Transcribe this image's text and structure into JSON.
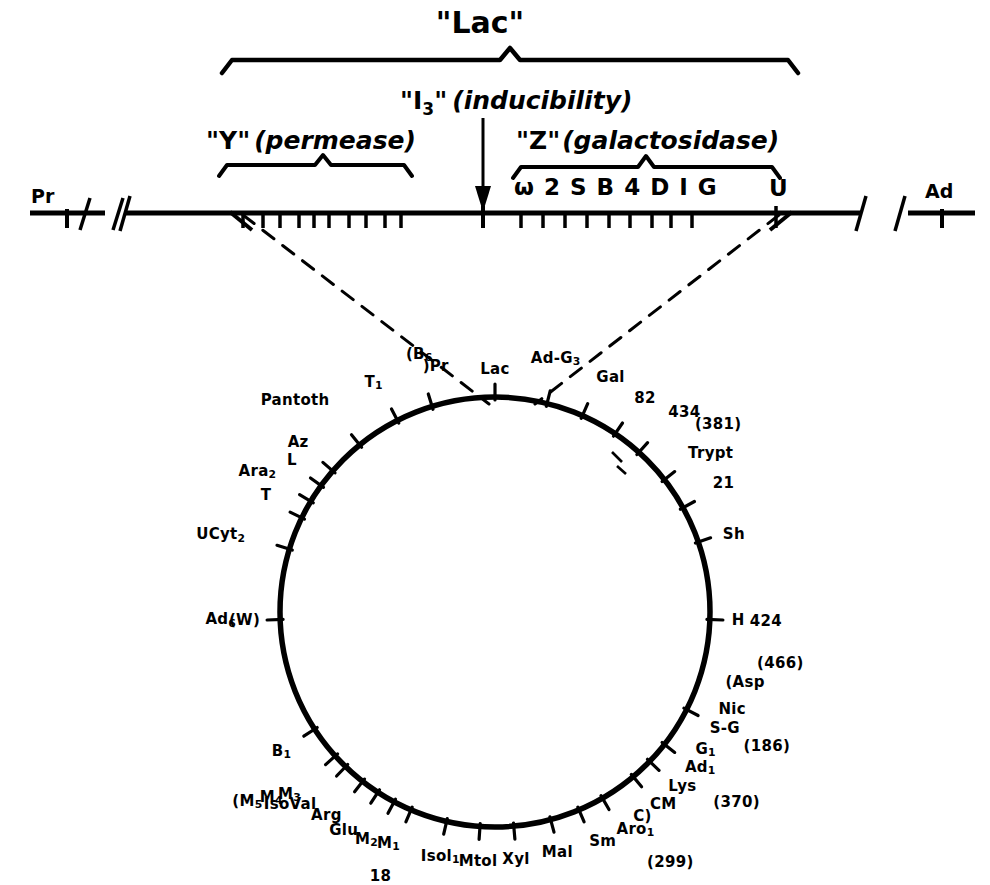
{
  "figure": {
    "type": "genetic-map",
    "title_top": "\"Lac\""
  },
  "linear_map": {
    "left_marker": "Pr",
    "right_marker": "Ad",
    "brackets": [
      {
        "id": "lac",
        "label": "\"Lac\"",
        "qualifier": ""
      },
      {
        "id": "y",
        "label": "\"Y\"",
        "qualifier": "(permease)"
      },
      {
        "id": "z",
        "label": "\"Z\"",
        "qualifier": "(galactosidase)"
      }
    ],
    "arrow_label_main": "\"I",
    "arrow_label_sub": "3",
    "arrow_label_close": "\"",
    "arrow_label_qualifier": "(inducibility)",
    "site_markers": [
      "ω",
      "2",
      "S",
      "B",
      "4",
      "D",
      "I",
      "G"
    ],
    "far_right_site": "U",
    "left_tick_count": 11,
    "right_tick_count": 10
  },
  "circular_map": {
    "center_label": "",
    "markers": [
      {
        "label": "Lac",
        "angle": 270,
        "r_label": 20,
        "tick": true,
        "side": "out"
      },
      {
        "label": "Ad-G",
        "sub": "3",
        "angle": 284,
        "r_label": 36,
        "tick": true,
        "side": "out"
      },
      {
        "label": "Gal",
        "angle": 294,
        "r_label": 34,
        "tick": true,
        "side": "out"
      },
      {
        "label": "82",
        "angle": 304,
        "r_label": 34,
        "tick": true,
        "side": "out"
      },
      {
        "label": "434",
        "angle": 312,
        "r_label": 44,
        "tick": true,
        "side": "out"
      },
      {
        "label": "(381)",
        "angle": 318,
        "r_label": 54,
        "tick": false,
        "side": "out"
      },
      {
        "label": "Trypt",
        "angle": 322,
        "r_label": 30,
        "tick": true,
        "side": "out"
      },
      {
        "label": "21",
        "angle": 331,
        "r_label": 34,
        "tick": true,
        "side": "out"
      },
      {
        "label": "Sh",
        "angle": 341,
        "r_label": 26,
        "tick": true,
        "side": "out"
      },
      {
        "label": "424",
        "angle": 2,
        "r_label": 40,
        "tick": true,
        "side": "out"
      },
      {
        "label": "H",
        "angle": 2,
        "r_label": 22,
        "tick": false,
        "side": "out"
      },
      {
        "label": "(466)",
        "angle": 11,
        "r_label": 52,
        "tick": false,
        "side": "out"
      },
      {
        "label": "(Asp",
        "angle": 17,
        "r_label": 26,
        "tick": false,
        "side": "out"
      },
      {
        "label": "Nic",
        "angle": 22,
        "r_label": 26,
        "tick": false,
        "side": "out"
      },
      {
        "label": "S-G",
        "angle": 27,
        "r_label": 26,
        "tick": true,
        "side": "out"
      },
      {
        "label": "(186)",
        "angle": 27,
        "r_label": 64,
        "tick": false,
        "side": "out"
      },
      {
        "label": "G",
        "sub": "1",
        "angle": 33,
        "r_label": 24,
        "tick": false,
        "side": "out"
      },
      {
        "label": "Ad",
        "sub": "1",
        "angle": 38,
        "r_label": 26,
        "tick": true,
        "side": "out"
      },
      {
        "label": "(370)",
        "angle": 40,
        "r_label": 70,
        "tick": false,
        "side": "out"
      },
      {
        "label": "Lys",
        "angle": 44,
        "r_label": 26,
        "tick": true,
        "side": "out"
      },
      {
        "label": "CM",
        "angle": 50,
        "r_label": 26,
        "tick": true,
        "side": "out"
      },
      {
        "label": "C)",
        "angle": 55,
        "r_label": 26,
        "tick": false,
        "side": "out"
      },
      {
        "label": "Aro",
        "sub": "1",
        "angle": 60,
        "r_label": 28,
        "tick": true,
        "side": "out"
      },
      {
        "label": "(299)",
        "angle": 58,
        "r_label": 72,
        "tick": false,
        "side": "out"
      },
      {
        "label": "Sm",
        "angle": 67,
        "r_label": 26,
        "tick": true,
        "side": "out"
      },
      {
        "label": "Mal",
        "angle": 75,
        "r_label": 26,
        "tick": true,
        "side": "out"
      },
      {
        "label": "Xyl",
        "angle": 85,
        "r_label": 26,
        "tick": true,
        "side": "out"
      },
      {
        "label": "Mtol",
        "angle": 94,
        "r_label": 28,
        "tick": true,
        "side": "out"
      },
      {
        "label": "Isol",
        "sub": "1",
        "angle": 103,
        "r_label": 28,
        "tick": true,
        "side": "out"
      },
      {
        "label": "M",
        "sub": "1",
        "angle": 113,
        "r_label": 28,
        "tick": true,
        "side": "out"
      },
      {
        "label": "M",
        "sub": "2",
        "angle": 118,
        "r_label": 34,
        "tick": true,
        "side": "out"
      },
      {
        "label": "18",
        "angle": 112,
        "r_label": 62,
        "tick": false,
        "side": "out"
      },
      {
        "label": "Glu",
        "angle": 123,
        "r_label": 36,
        "tick": true,
        "side": "out"
      },
      {
        "label": "Arg",
        "angle": 128,
        "r_label": 34,
        "tick": true,
        "side": "out"
      },
      {
        "label": "IsoVal",
        "angle": 134,
        "r_label": 42,
        "tick": true,
        "side": "out"
      },
      {
        "label": "(M",
        "sub": "5",
        "angle": 142,
        "r_label": 80,
        "tick": false,
        "side": "out"
      },
      {
        "label": "M",
        "sub": "4",
        "angle": 140,
        "r_label": 62,
        "tick": false,
        "side": "out"
      },
      {
        "label": "M",
        "sub": "3",
        "angle": 138,
        "r_label": 46,
        "tick": true,
        "side": "out"
      },
      {
        "label": "B",
        "sub": "1",
        "angle": 147,
        "r_label": 28,
        "tick": true,
        "side": "out"
      },
      {
        "label": "Ad",
        "sub": "6",
        "angle": 178,
        "r_label": 44,
        "tick": true,
        "side": "out"
      },
      {
        "label": "(W)",
        "angle": 178,
        "r_label": 20,
        "tick": false,
        "side": "out"
      },
      {
        "label": "UCyt",
        "sub": "2",
        "angle": 197,
        "r_label": 46,
        "tick": true,
        "side": "out"
      },
      {
        "label": "T",
        "angle": 206,
        "r_label": 34,
        "tick": true,
        "side": "out"
      },
      {
        "label": "Ara",
        "sub": "2",
        "angle": 211,
        "r_label": 40,
        "tick": true,
        "side": "out"
      },
      {
        "label": "L",
        "angle": 216,
        "r_label": 30,
        "tick": true,
        "side": "out"
      },
      {
        "label": "Az",
        "angle": 221,
        "r_label": 32,
        "tick": true,
        "side": "out"
      },
      {
        "label": "Pantoth",
        "angle": 231,
        "r_label": 48,
        "tick": true,
        "side": "out"
      },
      {
        "label": "T",
        "sub": "1",
        "angle": 243,
        "r_label": 32,
        "tick": true,
        "side": "out"
      },
      {
        "label": "(B",
        "sub": "6",
        "angle": 253,
        "r_label": 44,
        "tick": true,
        "side": "out"
      },
      {
        "label": ")Pr",
        "angle": 256,
        "r_label": 30,
        "tick": false,
        "side": "out"
      }
    ]
  },
  "colors": {
    "ink": "#000000",
    "background": "#ffffff"
  }
}
